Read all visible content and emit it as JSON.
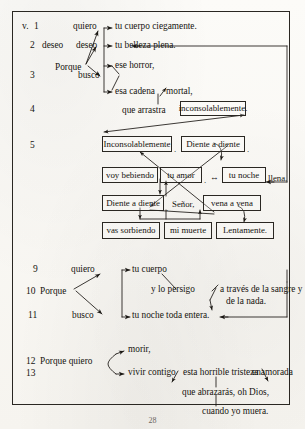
{
  "document": {
    "type": "linguistic-syntax-diagram",
    "language": "Spanish",
    "frame_border_color": "#2a2722",
    "ink_color": "#15130f",
    "paper_color": "#fbfaf7"
  },
  "verse_marker": "v.",
  "line_numbers": {
    "n1": "1",
    "n2": "2",
    "n3": "3",
    "n4": "4",
    "n5": "5",
    "n9": "9",
    "n10": "10",
    "n11": "11",
    "n12": "12",
    "n13": "13"
  },
  "stanza1": {
    "porque": "Porque",
    "deseo_left": "deseo",
    "verbs": {
      "quiero": "quiero",
      "deseo": "deseo",
      "busco": "busco"
    },
    "objects": {
      "o1": "tu cuerpo ciegamente.",
      "o2": "tu belleza plena.",
      "o3": "ese horror,",
      "o4": "esa cadena",
      "o4b": "mortal,"
    },
    "relative": "que arrastra",
    "boxed_adverb": "inconsolablemente."
  },
  "stanza2": {
    "row1": [
      "Inconsolablemente",
      "Diente a diente"
    ],
    "row1_punct": ".",
    "row1_punct2": ".",
    "row2": [
      "voy bebiendo",
      "tu amor",
      "tu noche"
    ],
    "row2_punct": ".",
    "row2_tail": "llena.",
    "row2_bidir": "↔",
    "row3": [
      "Diente a diente",
      "vena a vena"
    ],
    "row3_mid": "Señor,",
    "row3_punct": ".",
    "row4": [
      "vas sorbiendo",
      "mi muerte",
      "Lentamente."
    ]
  },
  "stanza3": {
    "porque": "Porque",
    "verbs": {
      "quiero": "quiero",
      "busco": "busco"
    },
    "objects": {
      "o1": "tu cuerpo",
      "o2": "tu noche toda entera."
    },
    "clause": "y lo persigo",
    "adjunct_line1": "a través de la sangre y",
    "adjunct_line2": "de la nada."
  },
  "stanza4": {
    "head": "Porque quiero",
    "branches": {
      "b1": "morir,",
      "b2": "vivir contigo"
    },
    "np_head": "esta horrible tristeza",
    "np_adj": "enamorada",
    "rel1": "que abrazarás, oh Dios,",
    "rel2": "cuando yo muera."
  },
  "page_number": "28"
}
